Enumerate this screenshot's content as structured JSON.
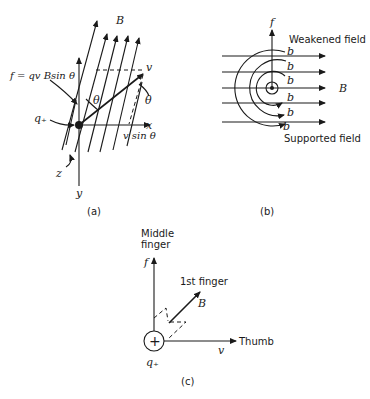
{
  "figure": {
    "panel_a": {
      "caption": "(a)",
      "labels": {
        "field": "B",
        "force_eq": "f = qv Bsin θ",
        "charge": "q₊",
        "velocity": "v",
        "angle1": "θ",
        "angle2": "θ",
        "x_axis": "x",
        "y_axis": "y",
        "z_axis": "z",
        "component": "v sin θ"
      }
    },
    "panel_b": {
      "caption": "(b)",
      "labels": {
        "force": "f",
        "weakened": "Weakened field",
        "supported": "Supported field",
        "field": "B",
        "b_marks": [
          "b",
          "b",
          "b",
          "b",
          "b",
          "b"
        ]
      }
    },
    "panel_c": {
      "caption": "(c)",
      "labels": {
        "middle_line1": "Middle",
        "middle_line2": "finger",
        "force": "f",
        "first_finger": "1st finger",
        "field": "B",
        "thumb": "Thumb",
        "velocity": "v",
        "charge": "q₊",
        "plus": "+"
      }
    },
    "colors": {
      "ink": "#1a1a1a",
      "background": "#ffffff"
    }
  }
}
